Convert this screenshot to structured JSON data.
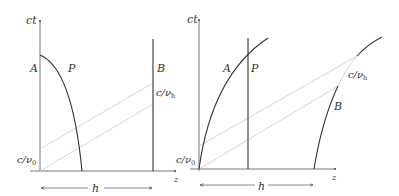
{
  "colors": {
    "ink": "#333333",
    "light_line": "#cfcfcf",
    "background": "#ffffff"
  },
  "left_panel": {
    "axis_y_label": "ct",
    "axis_x_label": "z",
    "curve_label_A": "A",
    "curve_label_P": "P",
    "curve_label_B": "B",
    "freq_high_label": "c/νh",
    "freq_high_label_main": "c/ν",
    "freq_high_label_sub": "h",
    "freq_low_label_main": "c/ν",
    "freq_low_label_sub": "0",
    "distance_label": "h"
  },
  "right_panel": {
    "axis_y_label": "ct",
    "axis_x_label": "z",
    "curve_label_A": "A",
    "curve_label_P": "P",
    "curve_label_B": "B",
    "freq_high_label_main": "c/ν",
    "freq_high_label_sub": "h",
    "freq_low_label_main": "c/ν",
    "freq_low_label_sub": "0",
    "distance_label": "h"
  }
}
